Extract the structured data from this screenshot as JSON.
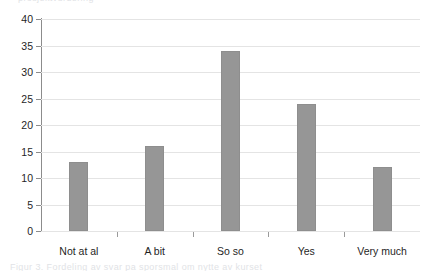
{
  "artifacts": {
    "top_clipped_text": "prosjektvurdering",
    "bottom_clipped_text": "Figur 3. Fordeling av svar pa sporsmal om nytte av kurset"
  },
  "chart_data": {
    "type": "bar",
    "title": "",
    "xlabel": "",
    "ylabel": "",
    "categories": [
      "Not at al",
      "A bit",
      "So so",
      "Yes",
      "Very much"
    ],
    "values": [
      13,
      16,
      34,
      24,
      12
    ],
    "series": [
      {
        "name": "Responses",
        "values": [
          13,
          16,
          34,
          24,
          12
        ]
      }
    ],
    "ylim": [
      0,
      40
    ],
    "ytick_step": 5,
    "yticks": [
      0,
      5,
      10,
      15,
      20,
      25,
      30,
      35,
      40
    ],
    "ytick_labels": [
      "0",
      "5",
      "10",
      "15",
      "20",
      "25",
      "30",
      "35",
      "40"
    ],
    "grid": true,
    "grid_axis": "y",
    "legend": false,
    "legend_position": "none",
    "bar_color": "#969696",
    "bar_border_color": "#8e8e8e",
    "gridline_color": "#e4e4e4",
    "axis_color": "#8c8c8c",
    "text_color": "#1f1f1f",
    "background": "#ffffff"
  }
}
